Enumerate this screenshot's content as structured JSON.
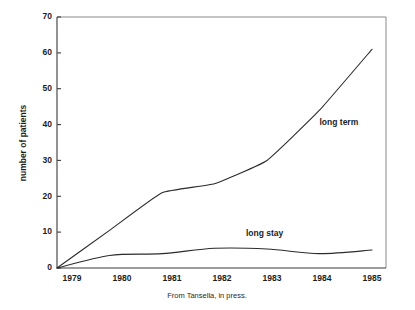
{
  "chart_data": {
    "type": "line",
    "title": "",
    "subtitle": "",
    "xlabel": "",
    "ylabel": "number of patients",
    "x": [
      1979,
      1980,
      1981,
      1982,
      1983,
      1984,
      1985
    ],
    "xtick_labels": [
      "1979",
      "1980",
      "1981",
      "1982",
      "1983",
      "1984",
      "1985"
    ],
    "ytick_labels": [
      "0",
      "10",
      "20",
      "30",
      "40",
      "50",
      "60",
      "70"
    ],
    "yticks": [
      0,
      10,
      20,
      30,
      40,
      50,
      60,
      70
    ],
    "xlim": [
      1979,
      1985
    ],
    "ylim": [
      0,
      70
    ],
    "grid": false,
    "legend_position": "inline-annotations",
    "series": [
      {
        "name": "long term",
        "values": [
          0,
          10.5,
          21,
          23.5,
          30,
          44,
          61
        ],
        "label_text": "long term",
        "color": "#2b2b2b"
      },
      {
        "name": "long stay",
        "values": [
          0,
          3.5,
          4,
          5.5,
          5.3,
          4,
          5
        ],
        "label_text": "long stay",
        "color": "#2b2b2b"
      }
    ],
    "annotations": [
      {
        "text": "long term",
        "x": 1984,
        "y": 40
      },
      {
        "text": "long stay",
        "x": 1982.6,
        "y": 9
      }
    ]
  },
  "caption": {
    "text": "From Tansella, in press."
  }
}
